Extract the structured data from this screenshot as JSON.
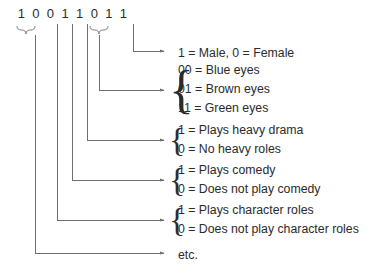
{
  "diagram": {
    "title_bits": "1 0 0 1 1 0 1 1",
    "bits": [
      "1",
      "0",
      "0",
      "1",
      "1",
      "0",
      "1",
      "1"
    ],
    "groups": [
      {
        "id": "sex-field",
        "source_bits": "bit-8",
        "lines": [
          "1 = Male, 0 = Female"
        ],
        "brace": "none"
      },
      {
        "id": "eye-color-field",
        "source_bits": "bits-6-7",
        "lines": [
          "00 = Blue eyes",
          "01 = Brown eyes",
          "11 = Green eyes"
        ],
        "brace": "{"
      },
      {
        "id": "heavy-drama-field",
        "source_bits": "bit-5",
        "lines": [
          "1 = Plays heavy drama",
          "0 = No heavy roles"
        ],
        "brace": "{"
      },
      {
        "id": "comedy-field",
        "source_bits": "bit-4",
        "lines": [
          "1 = Plays comedy",
          "0 = Does not play comedy"
        ],
        "brace": "{"
      },
      {
        "id": "character-roles-field",
        "source_bits": "bit-3",
        "lines": [
          "1 = Plays character roles",
          "0 = Does not play character roles"
        ],
        "brace": "{"
      },
      {
        "id": "etc-field",
        "source_bits": "bits-1-2",
        "lines": [
          "etc."
        ],
        "brace": "none"
      }
    ],
    "colors": {
      "text": "#2b2b2b",
      "line": "#6f6f6f",
      "background": "#ffffff"
    }
  }
}
